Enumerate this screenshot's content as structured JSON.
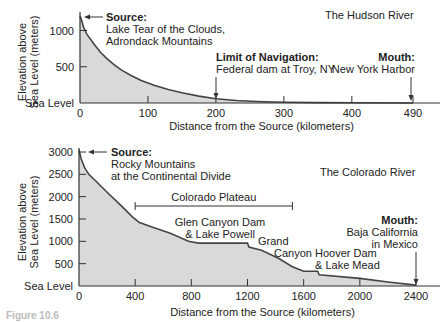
{
  "chart_data": [
    {
      "type": "area",
      "title": "The Hudson River",
      "xlabel": "Distance from the Source (kilometers)",
      "ylabel": "Elevation above Sea Level (meters)",
      "x_ticks": [
        0,
        100,
        200,
        300,
        400,
        490
      ],
      "y_ticks": [
        {
          "value": 0,
          "label": "Sea Level"
        },
        {
          "value": 500,
          "label": "500"
        },
        {
          "value": 1000,
          "label": "1000"
        }
      ],
      "xlim": [
        0,
        490
      ],
      "ylim": [
        0,
        1200
      ],
      "profile": [
        [
          0,
          1200
        ],
        [
          2,
          1150
        ],
        [
          5,
          1050
        ],
        [
          10,
          950
        ],
        [
          20,
          820
        ],
        [
          30,
          700
        ],
        [
          40,
          610
        ],
        [
          50,
          530
        ],
        [
          60,
          460
        ],
        [
          75,
          380
        ],
        [
          90,
          310
        ],
        [
          110,
          240
        ],
        [
          130,
          185
        ],
        [
          150,
          140
        ],
        [
          175,
          95
        ],
        [
          200,
          60
        ],
        [
          230,
          35
        ],
        [
          260,
          20
        ],
        [
          300,
          10
        ],
        [
          350,
          5
        ],
        [
          400,
          3
        ],
        [
          490,
          0
        ]
      ],
      "annotations": [
        {
          "title": "Source:",
          "text": [
            "Lake Tear of the Clouds,",
            "Adrondack Mountains"
          ],
          "x": 0,
          "y": 1200
        },
        {
          "title": "Limit of Navigation:",
          "text": [
            "Federal dam at Troy, NY"
          ],
          "x": 200,
          "y": 60
        },
        {
          "title": "Mouth:",
          "text": [
            "New York Harbor"
          ],
          "x": 490,
          "y": 0
        }
      ]
    },
    {
      "type": "area",
      "title": "The Colorado River",
      "xlabel": "Distance from the Source (kilometers)",
      "ylabel": "Elevation above Sea Level (meters)",
      "x_ticks": [
        0,
        400,
        800,
        1200,
        1600,
        2000,
        2400
      ],
      "y_ticks": [
        {
          "value": 0,
          "label": "Sea Level"
        },
        {
          "value": 500,
          "label": "500"
        },
        {
          "value": 1000,
          "label": "1000"
        },
        {
          "value": 1500,
          "label": "1500"
        },
        {
          "value": 2000,
          "label": "2000"
        },
        {
          "value": 2500,
          "label": "2500"
        },
        {
          "value": 3000,
          "label": "3000"
        }
      ],
      "xlim": [
        0,
        2400
      ],
      "ylim": [
        0,
        3000
      ],
      "profile": [
        [
          0,
          3050
        ],
        [
          15,
          2850
        ],
        [
          40,
          2650
        ],
        [
          70,
          2500
        ],
        [
          120,
          2350
        ],
        [
          200,
          2100
        ],
        [
          300,
          1800
        ],
        [
          380,
          1550
        ],
        [
          430,
          1420
        ],
        [
          520,
          1320
        ],
        [
          650,
          1180
        ],
        [
          780,
          1000
        ],
        [
          850,
          960
        ],
        [
          1200,
          960
        ],
        [
          1210,
          870
        ],
        [
          1300,
          800
        ],
        [
          1420,
          620
        ],
        [
          1520,
          430
        ],
        [
          1600,
          330
        ],
        [
          1700,
          330
        ],
        [
          1710,
          250
        ],
        [
          2000,
          170
        ],
        [
          2200,
          90
        ],
        [
          2400,
          20
        ]
      ],
      "regions": [
        {
          "label": "Colorado Plateau",
          "x_start": 400,
          "x_end": 1520
        }
      ],
      "annotations": [
        {
          "title": "Source:",
          "text": [
            "Rocky Mountains",
            "at the Continental Divide"
          ],
          "x": 0,
          "y": 3000
        },
        {
          "title": "",
          "text": [
            "Glen Canyon Dam",
            "& Lake Powell"
          ],
          "x": 1000,
          "y": 960
        },
        {
          "title": "",
          "text": [
            "Grand",
            "Canyon"
          ],
          "x": 1400,
          "y": 700
        },
        {
          "title": "",
          "text": [
            "Hoover Dam",
            "& Lake Mead"
          ],
          "x": 1700,
          "y": 330
        },
        {
          "title": "Mouth:",
          "text": [
            "Baja California",
            "in Mexico"
          ],
          "x": 2400,
          "y": 0
        }
      ]
    }
  ],
  "caption": "Figure 10.6"
}
